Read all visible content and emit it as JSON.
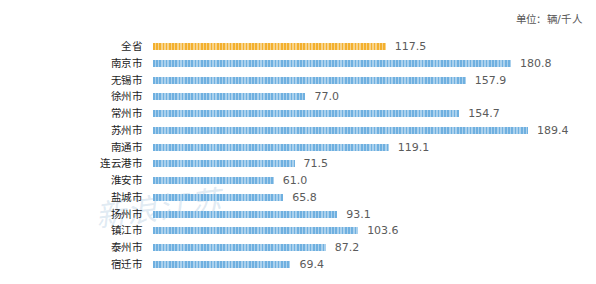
{
  "unit_note": "单位：辆/千人",
  "watermark_text": "新浪江苏",
  "colors": {
    "highlight_bar": "#f3b02e",
    "bar": "#6fb0e0",
    "value_text": "#5b5b5b",
    "category_text": "#1d1d1d",
    "background": "#ffffff"
  },
  "chart_data": {
    "type": "bar",
    "orientation": "horizontal",
    "title": "",
    "subtitle": "",
    "xlabel": "",
    "ylabel": "",
    "unit": "辆/千人",
    "xlim": [
      0,
      200
    ],
    "grid": false,
    "legend": "none",
    "value_label_format": "one-decimal",
    "highlight_category": "全省",
    "categories": [
      "全省",
      "南京市",
      "无锡市",
      "徐州市",
      "常州市",
      "苏州市",
      "南通市",
      "连云港市",
      "淮安市",
      "盐城市",
      "扬州市",
      "镇江市",
      "泰州市",
      "宿迁市"
    ],
    "values": [
      117.5,
      180.8,
      157.9,
      77.0,
      154.7,
      189.4,
      119.1,
      71.5,
      61.0,
      65.8,
      93.1,
      103.6,
      87.2,
      69.4
    ],
    "value_labels": [
      "117.5",
      "180.8",
      "157.9",
      "77.0",
      "154.7",
      "189.4",
      "119.1",
      "71.5",
      "61.0",
      "65.8",
      "93.1",
      "103.6",
      "87.2",
      "69.4"
    ]
  }
}
